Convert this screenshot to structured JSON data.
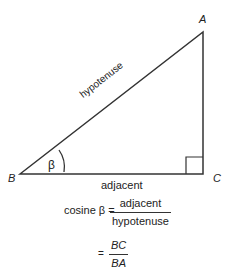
{
  "diagram": {
    "vertices": {
      "A": {
        "label": "A",
        "x": 203,
        "y": 32
      },
      "B": {
        "label": "B",
        "x": 20,
        "y": 174
      },
      "C": {
        "label": "C",
        "x": 203,
        "y": 174
      }
    },
    "sides": {
      "hypotenuse": "hypotenuse",
      "adjacent": "adjacent"
    },
    "angle_label": "β",
    "right_angle_at": "C",
    "line_color": "#333333"
  },
  "formula": {
    "lhs": "cosine β =",
    "line1": {
      "numerator": "adjacent",
      "denominator": "hypotenuse"
    },
    "equals": "=",
    "line2": {
      "numerator": "BC",
      "denominator": "BA"
    }
  }
}
